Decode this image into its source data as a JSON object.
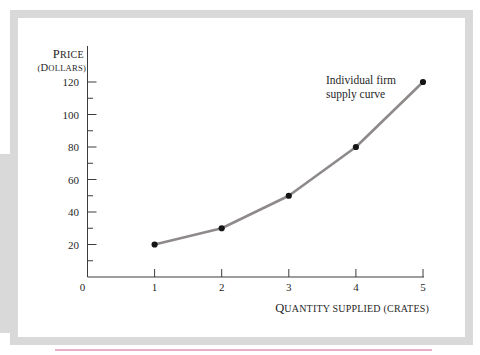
{
  "figure": {
    "annotation": {
      "line1": "Individual firm",
      "line2": "supply curve"
    }
  },
  "frame": {
    "border_color": "#d9d9d9",
    "left_edge_color": "#d9d9d9",
    "accent_line_color": "#e9aecb",
    "background": "#ffffff"
  },
  "chart_data": {
    "type": "line",
    "title": "",
    "x": [
      1,
      2,
      3,
      4,
      5
    ],
    "series": [
      {
        "name": "Individual firm supply curve",
        "values": [
          20,
          30,
          50,
          80,
          120
        ]
      }
    ],
    "xlabel": "Quantity supplied (crates)",
    "ylabel_lines": [
      "Price",
      "(Dollars)"
    ],
    "xlim": [
      0,
      5
    ],
    "ylim": [
      0,
      130
    ],
    "x_ticks": [
      1,
      2,
      3,
      4,
      5
    ],
    "y_ticks_major": [
      20,
      40,
      60,
      80,
      100,
      120
    ],
    "y_ticks_minor": [
      10,
      30,
      50,
      70,
      90,
      110
    ],
    "origin_label": "0",
    "grid": false,
    "legend_position": "annotation-upper-right",
    "annotation_lines": [
      "Individual firm",
      "supply curve"
    ],
    "colors": {
      "line": "#8e8a8a",
      "point": "#151515",
      "axis": "#3c3c3c",
      "text": "#1f1f1f"
    }
  }
}
